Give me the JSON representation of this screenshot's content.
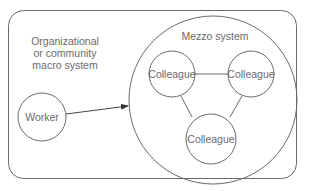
{
  "diagram": {
    "outer_box": {
      "label_lines": [
        "Organizational",
        "or community",
        "macro system"
      ]
    },
    "mezzo": {
      "label": "Mezzo system"
    },
    "worker": {
      "label": "Worker"
    },
    "colleagues": [
      {
        "label": "Colleague"
      },
      {
        "label": "Colleague"
      },
      {
        "label": "Colleague"
      }
    ],
    "colors": {
      "stroke": "#5a5a5a",
      "text": "#6a6a6a",
      "background": "#ffffff"
    }
  }
}
